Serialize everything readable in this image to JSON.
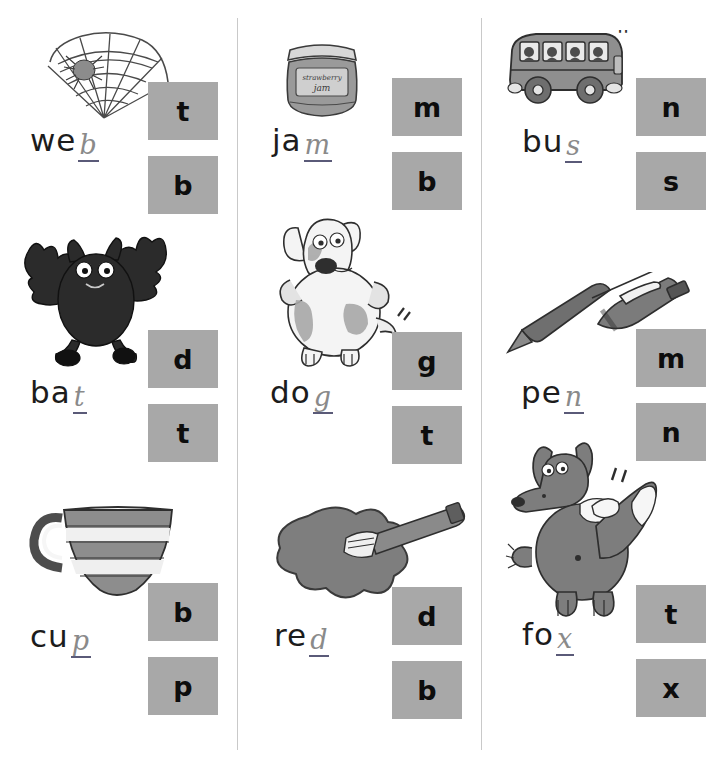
{
  "worksheet": {
    "title": "Phonics final-sound worksheet",
    "columns": 3,
    "rows": 3,
    "box_color": "#a8a8a8",
    "divider_color": "#c9c9c9",
    "top_smudge": "''"
  },
  "items": [
    {
      "id": "web",
      "picture": "spider-web-picture",
      "word_printed": "we",
      "word_handwritten": "b",
      "word_full": "web",
      "choices": [
        "t",
        "b"
      ],
      "correct": "b"
    },
    {
      "id": "jam",
      "picture": "jam-jar-picture",
      "word_printed": "ja",
      "word_handwritten": "m",
      "word_full": "jam",
      "choices": [
        "m",
        "b"
      ],
      "correct": "m",
      "label_text": "strawberry jam"
    },
    {
      "id": "bus",
      "picture": "bus-picture",
      "word_printed": "bu",
      "word_handwritten": "s",
      "word_full": "bus",
      "choices": [
        "n",
        "s"
      ],
      "correct": "s"
    },
    {
      "id": "bat",
      "picture": "bat-picture",
      "word_printed": "ba",
      "word_handwritten": "t",
      "word_full": "bat",
      "choices": [
        "d",
        "t"
      ],
      "correct": "t"
    },
    {
      "id": "dog",
      "picture": "dog-picture",
      "word_printed": "do",
      "word_handwritten": "g",
      "word_full": "dog",
      "choices": [
        "g",
        "t"
      ],
      "correct": "g"
    },
    {
      "id": "pen",
      "picture": "pen-picture",
      "word_printed": "pe",
      "word_handwritten": "n",
      "word_full": "pen",
      "choices": [
        "m",
        "n"
      ],
      "correct": "n"
    },
    {
      "id": "cup",
      "picture": "cup-picture",
      "word_printed": "cu",
      "word_handwritten": "p",
      "word_full": "cup",
      "choices": [
        "b",
        "p"
      ],
      "correct": "p"
    },
    {
      "id": "red",
      "picture": "red-paint-splat-picture",
      "word_printed": "re",
      "word_handwritten": "d",
      "word_full": "red",
      "choices": [
        "d",
        "b"
      ],
      "correct": "d"
    },
    {
      "id": "fox",
      "picture": "fox-picture",
      "word_printed": "fo",
      "word_handwritten": "x",
      "word_full": "fox",
      "choices": [
        "t",
        "x"
      ],
      "correct": "x"
    }
  ]
}
